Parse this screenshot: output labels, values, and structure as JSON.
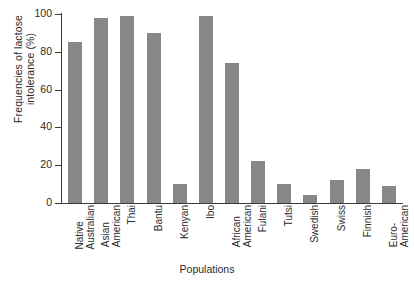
{
  "chart_data": {
    "type": "bar",
    "title": "",
    "xlabel": "Populations",
    "ylabel": "Frequencies of lactose intolerance (%)",
    "ylabel_lines": [
      "Frequencies of lactose",
      "intolerance (%)"
    ],
    "ylim": [
      0,
      100
    ],
    "yticks": [
      0,
      20,
      40,
      60,
      80,
      100
    ],
    "ytick_labels": [
      "0",
      "20",
      "40",
      "60",
      "80",
      "100"
    ],
    "grid": false,
    "legend": false,
    "bar_color": "#878787",
    "axis_color": "#3a3a3a",
    "background": "#ffffff",
    "categories": [
      "Native Australian",
      "Asian American",
      "Thai",
      "Bantu",
      "Kenyan",
      "Ibo",
      "African American",
      "Fulani",
      "Tutsi",
      "Swedish",
      "Swiss",
      "Finnish",
      "Euro-American"
    ],
    "category_lines": [
      [
        "Native",
        "Australian"
      ],
      [
        "Asian",
        "American"
      ],
      [
        "Thai"
      ],
      [
        "Bantu"
      ],
      [
        "Kenyan"
      ],
      [
        "Ibo"
      ],
      [
        "African",
        "American"
      ],
      [
        "Fulani"
      ],
      [
        "Tutsi"
      ],
      [
        "Swedish"
      ],
      [
        "Swiss"
      ],
      [
        "Finnish"
      ],
      [
        "Euro-",
        "American"
      ]
    ],
    "values": [
      85,
      98,
      99,
      90,
      10,
      99,
      74,
      22,
      10,
      4,
      12,
      18,
      9
    ]
  }
}
